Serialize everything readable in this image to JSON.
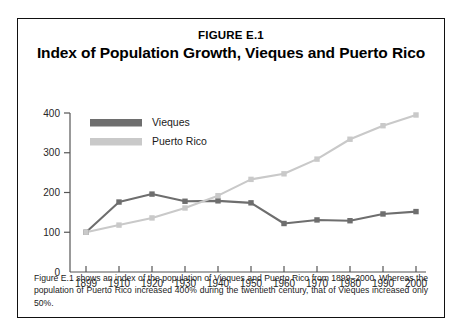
{
  "figure": {
    "number": "FIGURE E.1",
    "title": "Index of Population Growth, Vieques and Puerto Rico",
    "caption": "Figure E.1 shows an index of the population of Vieques and Puerto Rico from 1899–2000. Whereas the population of Puerto Rico increased 400% during the twentieth century, that of Vieques increased only 50%."
  },
  "colors": {
    "vieques": "#6e6e6e",
    "puerto_rico": "#c9c9c9",
    "axis": "#555555",
    "frame": "#111111",
    "text": "#1a1a1a"
  },
  "chart_data": {
    "type": "line",
    "title": "Index of Population Growth, Vieques and Puerto Rico",
    "xlabel": "",
    "ylabel": "",
    "categories": [
      "1899",
      "1910",
      "1920",
      "1930",
      "1940",
      "1950",
      "1960",
      "1970",
      "1980",
      "1990",
      "2000"
    ],
    "x": [
      1899,
      1910,
      1920,
      1930,
      1940,
      1950,
      1960,
      1970,
      1980,
      1990,
      2000
    ],
    "series": [
      {
        "name": "Vieques",
        "color": "#6e6e6e",
        "values": [
          100,
          176,
          196,
          178,
          179,
          174,
          122,
          131,
          129,
          146,
          152
        ]
      },
      {
        "name": "Puerto Rico",
        "color": "#c9c9c9",
        "values": [
          100,
          118,
          136,
          161,
          192,
          233,
          247,
          284,
          334,
          368,
          395
        ]
      }
    ],
    "ylim": [
      0,
      400
    ],
    "yticks": [
      0,
      100,
      200,
      300,
      400
    ],
    "ytick_labels": [
      "0",
      "100",
      "200",
      "300",
      "400"
    ],
    "grid": false,
    "legend_position": "top-left",
    "legend_entries": [
      "Vieques",
      "Puerto Rico"
    ]
  }
}
